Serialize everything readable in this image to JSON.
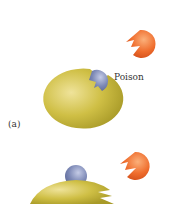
{
  "diagram": {
    "panels": [
      {
        "id": "a",
        "label": "(a)",
        "annotation": "Poison"
      },
      {
        "id": "b",
        "label": ""
      }
    ],
    "colors": {
      "enzyme": "#c8b93c",
      "enzyme_highlight": "#ece08a",
      "substrate": "#ee6a2c",
      "substrate_highlight": "#f8a070",
      "poison": "#7a86b4",
      "poison_highlight": "#b8c0e0",
      "background": "#ffffff"
    }
  }
}
